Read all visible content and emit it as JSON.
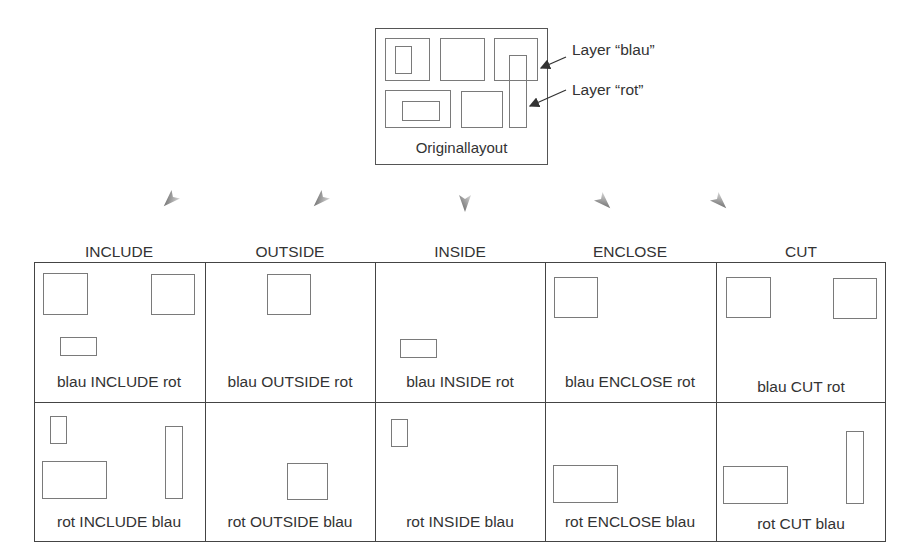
{
  "original_layout": {
    "caption": "Originallayout",
    "layer_blau_label": "Layer “blau”",
    "layer_rot_label": "Layer “rot”"
  },
  "operations": [
    {
      "name": "INCLUDE"
    },
    {
      "name": "OUTSIDE"
    },
    {
      "name": "INSIDE"
    },
    {
      "name": "ENCLOSE"
    },
    {
      "name": "CUT"
    }
  ],
  "grid": {
    "row_blau": [
      {
        "label": "blau INCLUDE rot"
      },
      {
        "label": "blau OUTSIDE rot"
      },
      {
        "label": "blau INSIDE rot"
      },
      {
        "label": "blau ENCLOSE rot"
      },
      {
        "label": "blau CUT rot"
      }
    ],
    "row_rot": [
      {
        "label": "rot INCLUDE blau"
      },
      {
        "label": "rot OUTSIDE blau"
      },
      {
        "label": "rot INSIDE blau"
      },
      {
        "label": "rot ENCLOSE blau"
      },
      {
        "label": "rot CUT blau"
      }
    ]
  },
  "colors": {
    "shape_stroke": "#7a7a7a",
    "grid_stroke": "#444444",
    "arrow_gray": "#6e6e6e"
  }
}
